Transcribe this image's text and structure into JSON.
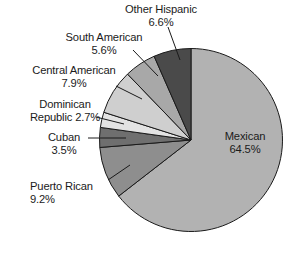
{
  "chart_data": {
    "type": "pie",
    "title": "",
    "subtitle": "",
    "xlabel": "",
    "ylabel": "",
    "legend_position": "none",
    "grid": false,
    "units": "percent",
    "total": 100.0,
    "start_angle_deg": 0,
    "direction": "clockwise",
    "categories": [
      "Mexican",
      "Puerto Rican",
      "Cuban",
      "Dominican Republic",
      "Central American",
      "South American",
      "Other Hispanic"
    ],
    "values": [
      64.5,
      9.2,
      3.5,
      2.7,
      7.9,
      5.6,
      6.6
    ],
    "slices": [
      {
        "name": "Mexican",
        "value": 64.5,
        "value_label": "64.5%",
        "label": "Mexican",
        "color": "#b2b2b2",
        "label_placement": "inside"
      },
      {
        "name": "Puerto Rican",
        "value": 9.2,
        "value_label": "9.2%",
        "label": "Puerto Rican",
        "color": "#8e8e8e",
        "label_placement": "outside-left"
      },
      {
        "name": "Cuban",
        "value": 3.5,
        "value_label": "3.5%",
        "label": "Cuban",
        "color": "#6f6f6f",
        "label_placement": "outside-left"
      },
      {
        "name": "Dominican Republic",
        "value": 2.7,
        "value_label": "2.7%",
        "label": "Dominican Republic",
        "color": "#e3e3e3",
        "label_placement": "outside-left"
      },
      {
        "name": "Central American",
        "value": 7.9,
        "value_label": "7.9%",
        "label": "Central American",
        "color": "#cfcfcf",
        "label_placement": "outside-left"
      },
      {
        "name": "South American",
        "value": 5.6,
        "value_label": "5.6%",
        "label": "South American",
        "color": "#a8a8a8",
        "label_placement": "outside-left"
      },
      {
        "name": "Other Hispanic",
        "value": 6.6,
        "value_label": "6.6%",
        "label": "Other Hispanic",
        "color": "#4a4a4a",
        "label_placement": "outside-top"
      }
    ]
  },
  "labels": {
    "other_hispanic": {
      "name": "Other Hispanic",
      "pct": "6.6%"
    },
    "south_american": {
      "name": "South American",
      "pct": "5.6%"
    },
    "central_american": {
      "name": "Central American",
      "pct": "7.9%"
    },
    "dominican": {
      "line1": "Dominican",
      "line2": "Republic 2.7%"
    },
    "cuban": {
      "name": "Cuban",
      "pct": "3.5%"
    },
    "puerto_rican": {
      "name": "Puerto Rican",
      "pct": "9.2%"
    },
    "mexican": {
      "name": "Mexican",
      "pct": "64.5%"
    }
  },
  "style": {
    "background": "#ffffff",
    "text_color": "#1b1b1b",
    "outline_color": "#1a1a1a"
  }
}
